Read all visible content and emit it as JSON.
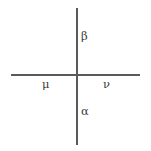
{
  "figure": {
    "name": "greek-letter-axes-diagram",
    "background_color": "#ffffff",
    "line_color": "#5a5a5a",
    "text_color": "#3a3a3a",
    "width": 151,
    "height": 151,
    "axes": {
      "vertical": {
        "label": "vertical-line",
        "x": 77,
        "y_start": 8,
        "y_end": 145
      },
      "horizontal": {
        "label": "horizontal-line",
        "y": 75,
        "x_start": 11,
        "x_end": 140
      },
      "intersection": {
        "x": 77,
        "y": 75
      }
    },
    "labels": {
      "top": "β",
      "bottom": "α",
      "left": "μ",
      "right": "ν"
    },
    "label_names": {
      "top": "beta",
      "bottom": "alpha",
      "left": "mu",
      "right": "nu"
    }
  }
}
